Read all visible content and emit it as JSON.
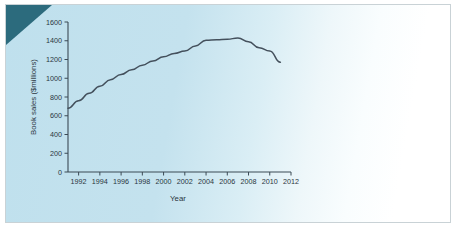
{
  "figure": {
    "background_color": "#c4e2ee",
    "corner_wedge_color": "#2c6b7d",
    "line_color": "#44505c",
    "axis_color": "#3b4a55"
  },
  "chart_data": {
    "type": "line",
    "title": "",
    "xlabel": "Year",
    "ylabel": "Book sales ($millions)",
    "xlim": [
      1991,
      2012
    ],
    "ylim": [
      0,
      1600
    ],
    "grid": false,
    "legend": "none",
    "xticks": [
      1992,
      1994,
      1996,
      1998,
      2000,
      2002,
      2004,
      2006,
      2008,
      2010,
      2012
    ],
    "xtick_labels": [
      "1992",
      "1994",
      "1996",
      "1998",
      "2000",
      "2002",
      "2004",
      "2006",
      "2008",
      "2010",
      "2012"
    ],
    "yticks": [
      0,
      200,
      400,
      600,
      800,
      1000,
      1200,
      1400,
      1600
    ],
    "ytick_labels": [
      "0",
      "200",
      "400",
      "600",
      "800",
      "1000",
      "1200",
      "1400",
      "1600"
    ],
    "x": [
      1991,
      1992,
      1993,
      1994,
      1995,
      1996,
      1997,
      1998,
      1999,
      2000,
      2001,
      2002,
      2003,
      2004,
      2005,
      2006,
      2007,
      2008,
      2009,
      2010,
      2011
    ],
    "values": [
      680,
      760,
      840,
      915,
      985,
      1040,
      1090,
      1140,
      1185,
      1230,
      1265,
      1290,
      1345,
      1405,
      1410,
      1415,
      1430,
      1390,
      1325,
      1290,
      1170
    ]
  }
}
